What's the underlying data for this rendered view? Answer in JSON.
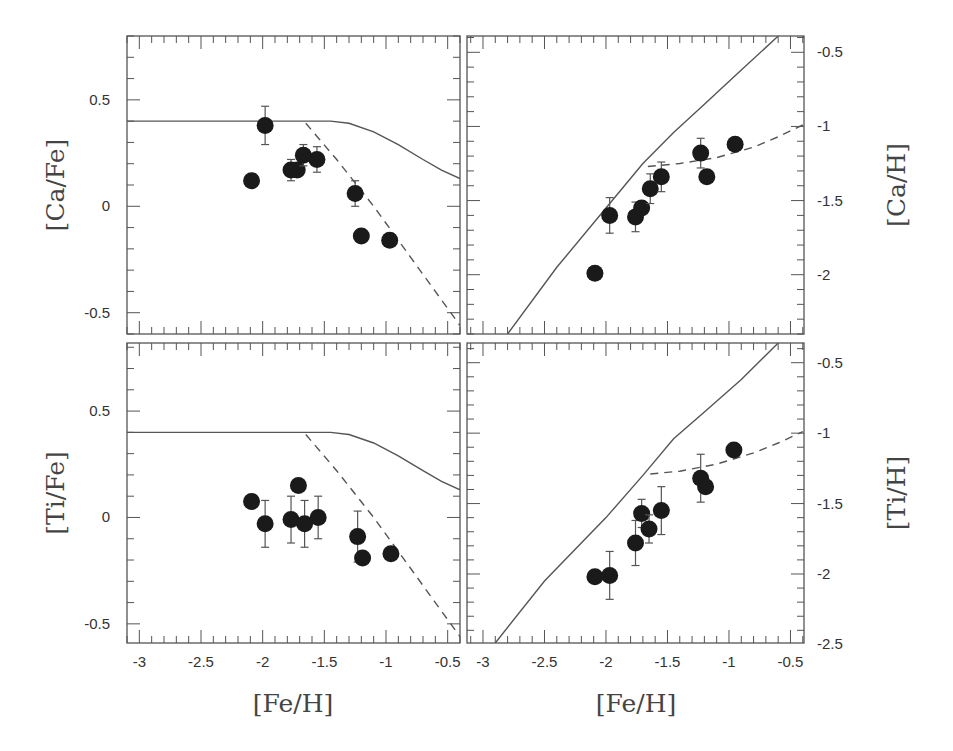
{
  "figure": {
    "x_axis_title": "[Fe/H]",
    "colors": {
      "frame": "#555555",
      "points": "#1a1a1a",
      "text": "#333333"
    }
  },
  "chart_data": [
    {
      "type": "scatter",
      "id": "ca_fe",
      "position": "top-left",
      "title": "",
      "xlabel": "[Fe/H]",
      "ylabel": "[Ca/Fe]",
      "xlim": [
        -3.1,
        -0.4
      ],
      "ylim": [
        -0.6,
        0.8
      ],
      "xticks": [
        -3,
        -2.5,
        -2,
        -1.5,
        -1,
        -0.5
      ],
      "yticks": [
        -0.5,
        0,
        0.5
      ],
      "y_axis_side": "left",
      "grid": false,
      "points": [
        {
          "x": -2.09,
          "y": 0.12,
          "err": 0
        },
        {
          "x": -1.98,
          "y": 0.38,
          "err": 0.09
        },
        {
          "x": -1.77,
          "y": 0.17,
          "err": 0.05
        },
        {
          "x": -1.72,
          "y": 0.17,
          "err": 0
        },
        {
          "x": -1.67,
          "y": 0.24,
          "err": 0.05
        },
        {
          "x": -1.56,
          "y": 0.22,
          "err": 0.06
        },
        {
          "x": -1.25,
          "y": 0.06,
          "err": 0.06
        },
        {
          "x": -1.2,
          "y": -0.14,
          "err": 0
        },
        {
          "x": -0.97,
          "y": -0.16,
          "err": 0
        }
      ],
      "solid_model": [
        [
          -3.1,
          0.4
        ],
        [
          -1.45,
          0.4
        ],
        [
          -1.3,
          0.39
        ],
        [
          -1.1,
          0.35
        ],
        [
          -0.9,
          0.29
        ],
        [
          -0.7,
          0.22
        ],
        [
          -0.55,
          0.17
        ],
        [
          -0.4,
          0.13
        ]
      ],
      "dashed_model": [
        [
          -1.65,
          0.39
        ],
        [
          -1.4,
          0.22
        ],
        [
          -1.1,
          0.0
        ],
        [
          -0.8,
          -0.24
        ],
        [
          -0.6,
          -0.4
        ],
        [
          -0.4,
          -0.56
        ]
      ]
    },
    {
      "type": "scatter",
      "id": "ca_h",
      "position": "top-right",
      "title": "",
      "xlabel": "[Fe/H]",
      "ylabel": "[Ca/H]",
      "xlim": [
        -3.13,
        -0.39
      ],
      "ylim": [
        -2.4,
        -0.39
      ],
      "xticks": [
        -3,
        -2.5,
        -2,
        -1.5,
        -1,
        -0.5
      ],
      "yticks": [
        -2,
        -1.5,
        -1,
        -0.5
      ],
      "y_axis_side": "right",
      "grid": false,
      "points": [
        {
          "x": -2.09,
          "y": -1.99,
          "err": 0
        },
        {
          "x": -1.97,
          "y": -1.6,
          "err": 0.12
        },
        {
          "x": -1.76,
          "y": -1.61,
          "err": 0.1
        },
        {
          "x": -1.71,
          "y": -1.55,
          "err": 0
        },
        {
          "x": -1.64,
          "y": -1.42,
          "err": 0.1
        },
        {
          "x": -1.55,
          "y": -1.34,
          "err": 0.1
        },
        {
          "x": -1.23,
          "y": -1.18,
          "err": 0.1
        },
        {
          "x": -1.18,
          "y": -1.34,
          "err": 0
        },
        {
          "x": -0.95,
          "y": -1.12,
          "err": 0
        }
      ],
      "solid_model": [
        [
          -2.8,
          -2.4
        ],
        [
          -2.4,
          -1.95
        ],
        [
          -2.0,
          -1.55
        ],
        [
          -1.7,
          -1.25
        ],
        [
          -1.45,
          -1.04
        ],
        [
          -1.2,
          -0.85
        ],
        [
          -0.9,
          -0.62
        ],
        [
          -0.6,
          -0.39
        ]
      ],
      "dashed_model": [
        [
          -1.66,
          -1.27
        ],
        [
          -1.4,
          -1.25
        ],
        [
          -1.1,
          -1.21
        ],
        [
          -0.8,
          -1.14
        ],
        [
          -0.6,
          -1.07
        ],
        [
          -0.4,
          -0.99
        ]
      ]
    },
    {
      "type": "scatter",
      "id": "ti_fe",
      "position": "bottom-left",
      "title": "",
      "xlabel": "[Fe/H]",
      "ylabel": "[Ti/Fe]",
      "xlim": [
        -3.1,
        -0.4
      ],
      "ylim": [
        -0.59,
        0.82
      ],
      "xticks": [
        -3,
        -2.5,
        -2,
        -1.5,
        -1,
        -0.5
      ],
      "yticks": [
        -0.5,
        0,
        0.5
      ],
      "y_axis_side": "left",
      "grid": false,
      "points": [
        {
          "x": -2.09,
          "y": 0.075,
          "err": 0
        },
        {
          "x": -1.98,
          "y": -0.03,
          "err": 0.11
        },
        {
          "x": -1.71,
          "y": 0.15,
          "err": 0
        },
        {
          "x": -1.77,
          "y": -0.01,
          "err": 0.11
        },
        {
          "x": -1.66,
          "y": -0.03,
          "err": 0.11
        },
        {
          "x": -1.55,
          "y": 0.0,
          "err": 0.1
        },
        {
          "x": -1.23,
          "y": -0.09,
          "err": 0.12
        },
        {
          "x": -1.19,
          "y": -0.19,
          "err": 0
        },
        {
          "x": -0.96,
          "y": -0.17,
          "err": 0
        }
      ],
      "solid_model": [
        [
          -3.1,
          0.4
        ],
        [
          -1.45,
          0.4
        ],
        [
          -1.3,
          0.39
        ],
        [
          -1.1,
          0.35
        ],
        [
          -0.9,
          0.29
        ],
        [
          -0.7,
          0.22
        ],
        [
          -0.55,
          0.17
        ],
        [
          -0.4,
          0.13
        ]
      ],
      "dashed_model": [
        [
          -1.65,
          0.39
        ],
        [
          -1.4,
          0.22
        ],
        [
          -1.1,
          0.0
        ],
        [
          -0.8,
          -0.24
        ],
        [
          -0.6,
          -0.4
        ],
        [
          -0.4,
          -0.56
        ]
      ]
    },
    {
      "type": "scatter",
      "id": "ti_h",
      "position": "bottom-right",
      "title": "",
      "xlabel": "[Fe/H]",
      "ylabel": "[Ti/H]",
      "xlim": [
        -3.13,
        -0.39
      ],
      "ylim": [
        -2.49,
        -0.36
      ],
      "xticks": [
        -3,
        -2.5,
        -2,
        -1.5,
        -1,
        -0.5
      ],
      "yticks": [
        -2.5,
        -2,
        -1.5,
        -1,
        -0.5
      ],
      "y_axis_side": "right",
      "grid": false,
      "points": [
        {
          "x": -2.09,
          "y": -2.02,
          "err": 0
        },
        {
          "x": -1.97,
          "y": -2.01,
          "err": 0.17
        },
        {
          "x": -1.76,
          "y": -1.78,
          "err": 0.16
        },
        {
          "x": -1.71,
          "y": -1.57,
          "err": 0.1
        },
        {
          "x": -1.65,
          "y": -1.68,
          "err": 0.1
        },
        {
          "x": -1.55,
          "y": -1.55,
          "err": 0.17
        },
        {
          "x": -1.23,
          "y": -1.32,
          "err": 0.17
        },
        {
          "x": -1.19,
          "y": -1.38,
          "err": 0
        },
        {
          "x": -0.96,
          "y": -1.12,
          "err": 0
        }
      ],
      "solid_model": [
        [
          -2.9,
          -2.49
        ],
        [
          -2.5,
          -2.05
        ],
        [
          -2.0,
          -1.6
        ],
        [
          -1.7,
          -1.3
        ],
        [
          -1.45,
          -1.04
        ],
        [
          -1.2,
          -0.85
        ],
        [
          -0.9,
          -0.62
        ],
        [
          -0.6,
          -0.36
        ]
      ],
      "dashed_model": [
        [
          -1.64,
          -1.29
        ],
        [
          -1.4,
          -1.27
        ],
        [
          -1.1,
          -1.22
        ],
        [
          -0.8,
          -1.14
        ],
        [
          -0.6,
          -1.07
        ],
        [
          -0.4,
          -0.99
        ]
      ]
    }
  ]
}
